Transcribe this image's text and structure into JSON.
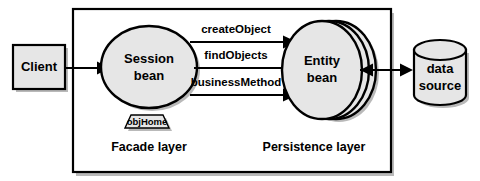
{
  "diagram": {
    "colors": {
      "shape_fill": "#e6e6e6",
      "shape_stroke": "#000000",
      "shadow": "#b9b9b9",
      "background": "#ffffff",
      "text": "#000000"
    },
    "nodes": {
      "client": {
        "label": "Client",
        "shape": "rectangle"
      },
      "session_bean": {
        "label_line1": "Session",
        "label_line2": "bean",
        "shape": "ellipse"
      },
      "entity_bean": {
        "label_line1": "Entity",
        "label_line2": "bean",
        "shape": "stacked-ellipse"
      },
      "data_source": {
        "label_line1": "data",
        "label_line2": "source",
        "shape": "cylinder"
      },
      "obj_home": {
        "label": "objHome",
        "shape": "trapezoid"
      }
    },
    "layers": {
      "facade": "Facade layer",
      "persistence": "Persistence layer"
    },
    "connections": [
      {
        "id": "client-to-session",
        "label": "",
        "from": "client",
        "to": "session_bean",
        "direction": "forward"
      },
      {
        "id": "create-object",
        "label": "createObject",
        "from": "session_bean",
        "to": "entity_bean",
        "direction": "forward"
      },
      {
        "id": "find-objects",
        "label": "findObjects",
        "from": "session_bean",
        "to": "entity_bean",
        "direction": "forward"
      },
      {
        "id": "business-method",
        "label": "businessMethod",
        "from": "session_bean",
        "to": "entity_bean",
        "direction": "forward"
      },
      {
        "id": "entity-to-datasource",
        "label": "",
        "from": "entity_bean",
        "to": "data_source",
        "direction": "bidirectional"
      }
    ]
  }
}
